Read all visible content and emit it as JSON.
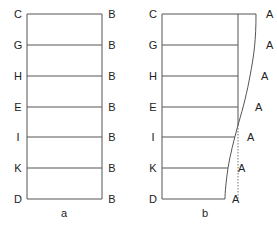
{
  "panel_a": {
    "caption": "a",
    "left_labels": [
      "C",
      "G",
      "H",
      "E",
      "I",
      "K",
      "D"
    ],
    "right_labels": [
      "B",
      "B",
      "B",
      "B",
      "B",
      "B",
      "B"
    ]
  },
  "panel_b": {
    "caption": "b",
    "left_labels": [
      "C",
      "G",
      "H",
      "E",
      "I",
      "K",
      "D"
    ],
    "right_labels": [
      "A",
      "A",
      "A",
      "A",
      "A",
      "A",
      "A"
    ]
  }
}
